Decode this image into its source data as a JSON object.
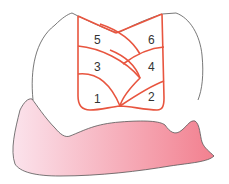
{
  "diagram": {
    "regions": [
      {
        "label": "5"
      },
      {
        "label": "6"
      },
      {
        "label": "3"
      },
      {
        "label": "4"
      },
      {
        "label": "1"
      },
      {
        "label": "2"
      }
    ],
    "colors": {
      "grid_line": "#e8553f",
      "tooth_outline": "#555555",
      "gum_light": "#fbe0ea",
      "gum_dark": "#f28a98",
      "label": "#333333"
    }
  }
}
